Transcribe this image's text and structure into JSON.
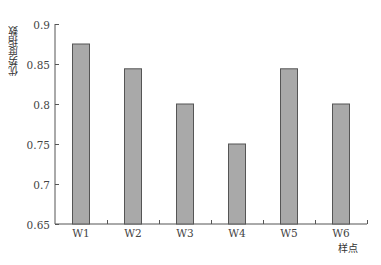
{
  "chart_data": {
    "type": "bar",
    "title": "",
    "xlabel": "样点",
    "ylabel": "优势度指数",
    "categories": [
      "W1",
      "W2",
      "W3",
      "W4",
      "W5",
      "W6"
    ],
    "values": [
      0.875,
      0.844,
      0.8,
      0.75,
      0.844,
      0.8
    ],
    "ylim": [
      0.65,
      0.9
    ],
    "yticks": [
      0.65,
      0.7,
      0.75,
      0.8,
      0.85,
      0.9
    ],
    "ytick_labels": [
      "0.65",
      "0.7",
      "0.75",
      "0.8",
      "0.85",
      "0.9"
    ],
    "grid": false,
    "legend": null,
    "colors": {
      "bar_fill": "#a9a9a9",
      "bar_stroke": "#555555",
      "axis": "#555555"
    }
  }
}
